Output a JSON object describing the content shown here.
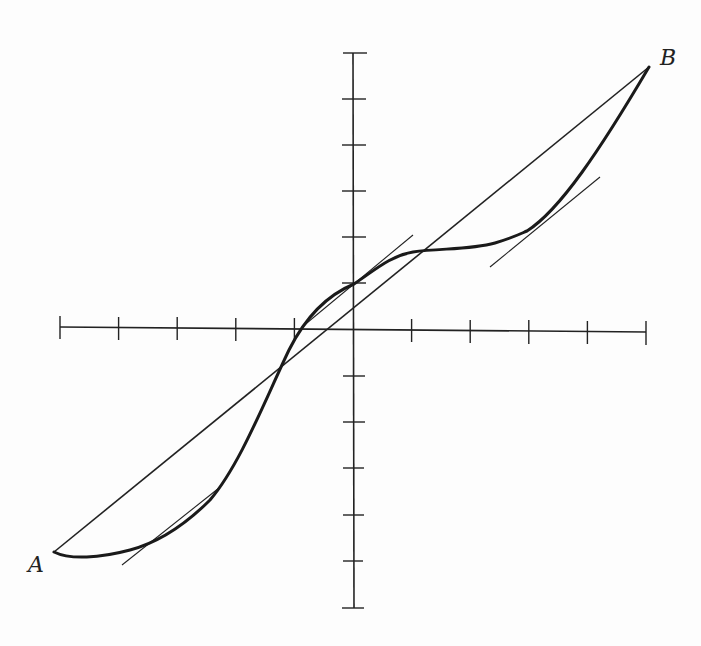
{
  "figure": {
    "labels": {
      "start_point": "A",
      "end_point": "B"
    },
    "colors": {
      "ink": "#222222",
      "background": "#fdfdfd"
    },
    "axes": {
      "x_ticks_left": 5,
      "x_ticks_right": 5,
      "y_ticks_up": 6,
      "y_ticks_down": 6
    },
    "points": {
      "A": [
        54,
        552
      ],
      "B": [
        649,
        67
      ]
    },
    "tangents": [
      {
        "name": "lower-left tangent",
        "from": [
          122,
          565
        ],
        "to": [
          219,
          488
        ]
      },
      {
        "name": "near-origin tangent",
        "from": [
          302,
          327
        ],
        "to": [
          413,
          235
        ]
      },
      {
        "name": "upper-right tangent",
        "from": [
          490,
          267
        ],
        "to": [
          600,
          177
        ]
      }
    ]
  }
}
